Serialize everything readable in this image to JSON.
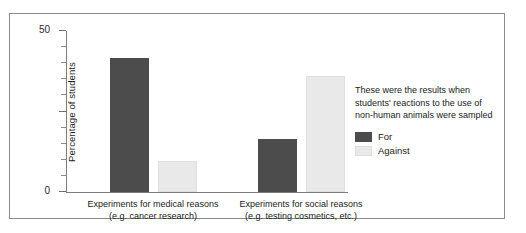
{
  "chart_data": {
    "type": "bar",
    "title": "",
    "xlabel": "",
    "ylabel": "Percentage of students",
    "ylim": [
      0,
      100
    ],
    "yticks": [
      0,
      50,
      100
    ],
    "ytick_labels": [
      "0",
      "50",
      "100"
    ],
    "minor_tick_step": 10,
    "grid": false,
    "legend_position": "right",
    "categories": [
      {
        "line1": "Experiments for medical reasons",
        "line2": "(e.g. cancer research)"
      },
      {
        "line1": "Experiments for social reasons",
        "line2": "(e.g. testing cosmetics, etc.)"
      }
    ],
    "series": [
      {
        "name": "For",
        "color": "#4c4c4c",
        "values": [
          83,
          33
        ]
      },
      {
        "name": "Against",
        "color": "#e9e9e9",
        "values": [
          19,
          72
        ]
      }
    ],
    "annotation": "These were the results when students' reactions to the use of non-human animals were sampled"
  },
  "legend": {
    "note_line1": "These were the results when",
    "note_line2": "students' reactions to the use of",
    "note_line3": "non-human animals were sampled",
    "entries": [
      {
        "label": "For",
        "color": "#4c4c4c"
      },
      {
        "label": "Against",
        "color": "#e9e9e9"
      }
    ]
  },
  "axis": {
    "y_title": "Percentage of students",
    "y_labels": [
      "100",
      "50",
      "0"
    ]
  }
}
